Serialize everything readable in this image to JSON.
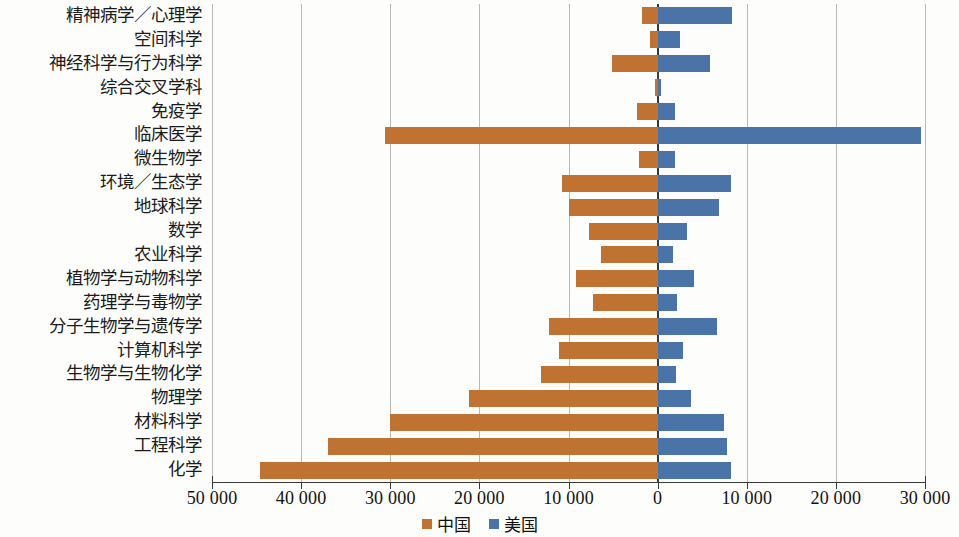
{
  "chart_data": {
    "type": "bar",
    "orientation": "horizontal",
    "layout": "diverging-bidirectional",
    "title": "",
    "xlabel": "",
    "ylabel": "",
    "grid": true,
    "legend_position": "bottom-center",
    "axis": {
      "left_max": 50000,
      "right_max": 30000,
      "zero_at": 0,
      "tick_step": 10000,
      "tick_labels": [
        "50 000",
        "40 000",
        "30 000",
        "20 000",
        "10 000",
        "0",
        "10 000",
        "20 000",
        "30 000"
      ],
      "tick_values": [
        -50000,
        -40000,
        -30000,
        -20000,
        -10000,
        0,
        10000,
        20000,
        30000
      ]
    },
    "series": [
      {
        "name": "中国",
        "side": "left",
        "color": "#c07232",
        "values": [
          1700,
          900,
          5100,
          300,
          2300,
          30600,
          2100,
          10700,
          10000,
          7700,
          6400,
          9200,
          7200,
          12200,
          11100,
          13100,
          21200,
          30000,
          37000,
          44600
        ]
      },
      {
        "name": "美国",
        "side": "right",
        "color": "#4a74a8",
        "values": [
          8300,
          2500,
          5900,
          400,
          1900,
          29500,
          1900,
          8200,
          6900,
          3300,
          1700,
          4100,
          2200,
          6700,
          2800,
          2100,
          3700,
          7400,
          7800,
          8200
        ]
      }
    ],
    "categories": [
      "精神病学／心理学",
      "空间科学",
      "神经科学与行为科学",
      "综合交叉学科",
      "免疫学",
      "临床医学",
      "微生物学",
      "环境／生态学",
      "地球科学",
      "数学",
      "农业科学",
      "植物学与动物科学",
      "药理学与毒物学",
      "分子生物学与遗传学",
      "计算机科学",
      "生物学与生物化学",
      "物理学",
      "材料科学",
      "工程科学",
      "化学"
    ]
  },
  "legend": {
    "items": [
      {
        "label": "中国",
        "color": "#c07232"
      },
      {
        "label": "美国",
        "color": "#4a74a8"
      }
    ]
  },
  "colors": {
    "china": "#c07232",
    "usa": "#4a74a8",
    "grid": "#b9b9b9",
    "axis": "#3a3a3a",
    "background": "#fdfdfb"
  }
}
